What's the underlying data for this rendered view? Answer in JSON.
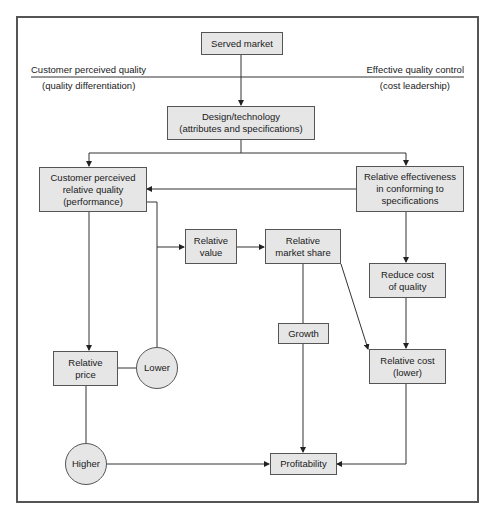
{
  "diagram": {
    "axis": {
      "left_top": "Customer perceived quality",
      "left_bottom": "(quality differentiation)",
      "right_top": "Effective quality control",
      "right_bottom": "(cost leadership)"
    },
    "nodes": {
      "served_market": "Served market",
      "design_technology": "Design/technology\n(attributes and specifications)",
      "customer_perceived_quality": "Customer perceived\nrelative quality\n(performance)",
      "relative_effectiveness": "Relative effectiveness\nin conforming to\nspecifications",
      "relative_value": "Relative\nvalue",
      "relative_market_share": "Relative\nmarket share",
      "reduce_cost_of_quality": "Reduce cost\nof quality",
      "growth": "Growth",
      "relative_price": "Relative\nprice",
      "lower": "Lower",
      "relative_cost": "Relative cost\n(lower)",
      "higher": "Higher",
      "profitability": "Profitability"
    },
    "edges": [
      {
        "from": "served_market",
        "to": "design_technology"
      },
      {
        "from": "design_technology",
        "to": "customer_perceived_quality"
      },
      {
        "from": "design_technology",
        "to": "relative_effectiveness"
      },
      {
        "from": "relative_effectiveness",
        "to": "customer_perceived_quality"
      },
      {
        "from": "customer_perceived_quality",
        "to": "relative_value"
      },
      {
        "from": "relative_value",
        "to": "relative_market_share"
      },
      {
        "from": "customer_perceived_quality",
        "to": "relative_price"
      },
      {
        "from": "relative_effectiveness",
        "to": "reduce_cost_of_quality"
      },
      {
        "from": "reduce_cost_of_quality",
        "to": "relative_cost"
      },
      {
        "from": "relative_market_share",
        "to": "relative_cost"
      },
      {
        "from": "relative_market_share",
        "to": "profitability",
        "via": "growth"
      },
      {
        "from": "relative_price",
        "to": "lower"
      },
      {
        "from": "lower",
        "to": "relative_value"
      },
      {
        "from": "relative_price",
        "to": "higher"
      },
      {
        "from": "higher",
        "to": "profitability"
      },
      {
        "from": "relative_cost",
        "to": "profitability"
      }
    ]
  }
}
